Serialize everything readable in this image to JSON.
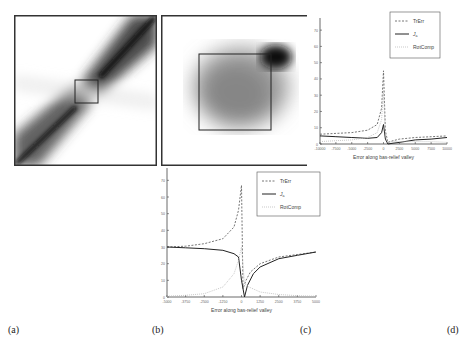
{
  "labels": {
    "a": "(a)",
    "b": "(b)",
    "c": "(c)",
    "d": "(d)"
  },
  "chart_data": [
    {
      "type": "line",
      "id": "top-right",
      "title": "",
      "xlabel": "Error along bas-relief valley",
      "ylabel": "",
      "xlim": [
        -10000,
        10000
      ],
      "ylim": [
        0,
        75
      ],
      "x_ticks": [
        "-10000",
        "-7500",
        "-5000",
        "-2500",
        "0",
        "2500",
        "5000",
        "7500",
        "10000"
      ],
      "y_ticks": [
        "0",
        "10",
        "20",
        "30",
        "40",
        "50",
        "60",
        "70"
      ],
      "legend": [
        "TrErr",
        "Ja",
        "RotComp"
      ],
      "legend_position": "upper right",
      "series": [
        {
          "name": "TrErr",
          "style": "dashed",
          "x": [
            -10000,
            -7500,
            -5000,
            -2500,
            -1000,
            -300,
            0,
            300,
            700,
            1500,
            2500,
            5000,
            7500,
            10000
          ],
          "values": [
            6,
            6.5,
            7,
            8.5,
            12,
            22,
            45,
            8,
            1,
            2,
            3,
            4,
            4.5,
            5
          ]
        },
        {
          "name": "Ja",
          "style": "solid",
          "x": [
            -10000,
            -7500,
            -5000,
            -2500,
            -1000,
            -300,
            0,
            300,
            700,
            1500,
            2500,
            5000,
            7500,
            10000
          ],
          "values": [
            5,
            4.5,
            4,
            3.5,
            4,
            7,
            12,
            3,
            0,
            0.5,
            1,
            2.5,
            3,
            4
          ]
        },
        {
          "name": "RotComp",
          "style": "dotted",
          "x": [
            -10000,
            -7500,
            -5000,
            -2500,
            -1000,
            -300,
            0,
            300,
            700,
            1500,
            2500,
            5000,
            7500,
            10000
          ],
          "values": [
            1.5,
            2,
            2.5,
            4,
            7,
            15,
            33,
            5,
            1,
            1.5,
            1.5,
            1.5,
            1.5,
            1
          ]
        }
      ]
    },
    {
      "type": "line",
      "id": "bottom",
      "title": "",
      "xlabel": "Error along bas-relief valley",
      "ylabel": "",
      "xlim": [
        -5000,
        5000
      ],
      "ylim": [
        0,
        75
      ],
      "x_ticks": [
        "-5000",
        "-3750",
        "-2500",
        "-1250",
        "0",
        "1250",
        "2500",
        "3750",
        "5000"
      ],
      "y_ticks": [
        "0",
        "10",
        "20",
        "30",
        "40",
        "50",
        "60",
        "70"
      ],
      "legend": [
        "TrErr",
        "Ja",
        "RotComp"
      ],
      "legend_position": "upper right",
      "series": [
        {
          "name": "TrErr",
          "style": "dashed",
          "x": [
            -5000,
            -3750,
            -2500,
            -1250,
            -500,
            -200,
            0,
            100,
            300,
            600,
            1250,
            2500,
            3750,
            5000
          ],
          "values": [
            30,
            30.5,
            32,
            35,
            42,
            52,
            67,
            5,
            10,
            15,
            20,
            24,
            25.5,
            27
          ]
        },
        {
          "name": "Ja",
          "style": "solid",
          "x": [
            -5000,
            -3750,
            -2500,
            -1250,
            -500,
            -200,
            0,
            200,
            400,
            800,
            1250,
            2500,
            3750,
            5000
          ],
          "values": [
            30,
            29.5,
            29,
            28,
            26,
            24,
            10,
            0,
            7,
            14,
            18,
            23,
            25,
            27
          ]
        },
        {
          "name": "RotComp",
          "style": "dotted",
          "x": [
            -5000,
            -3750,
            -2500,
            -1250,
            -500,
            -200,
            0,
            200,
            500,
            1250,
            2500,
            3750,
            5000
          ],
          "values": [
            0.5,
            1,
            2,
            6,
            14,
            22,
            30,
            8,
            6,
            3,
            1.5,
            0.8,
            0.5
          ]
        }
      ]
    }
  ],
  "images": {
    "a": {
      "desc": "density map with diagonal band and small inset box"
    },
    "b": {
      "desc": "zoomed density map with inset box"
    }
  }
}
